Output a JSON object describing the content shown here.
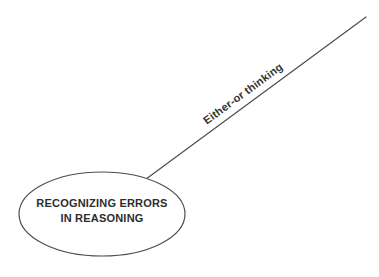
{
  "diagram": {
    "type": "concept-map",
    "center_node": {
      "label_line1": "RECOGNIZING ERRORS",
      "label_line2": "IN REASONING",
      "shape": "ellipse"
    },
    "branches": [
      {
        "label": "Either-or thinking"
      }
    ],
    "colors": {
      "background": "#ffffff",
      "stroke": "#4d4d4d",
      "node_text": "#2d2d2d",
      "branch_text": "#333333"
    }
  }
}
